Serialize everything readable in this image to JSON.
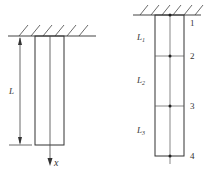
{
  "left_figure": {
    "length_label": "L",
    "axis_label": "x"
  },
  "right_figure": {
    "segments": [
      {
        "label": "L",
        "sub": "1"
      },
      {
        "label": "L",
        "sub": "2"
      },
      {
        "label": "L",
        "sub": "3"
      }
    ],
    "nodes": [
      "1",
      "2",
      "3",
      "4"
    ]
  },
  "colors": {
    "line": "#333333",
    "thin": "#555555"
  }
}
